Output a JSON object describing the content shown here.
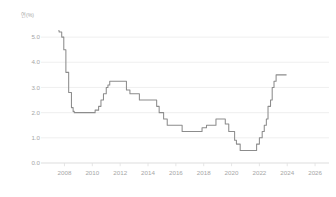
{
  "chart_data": {
    "type": "line",
    "title": "",
    "subtitle": "",
    "xlabel": "",
    "ylabel": "연(%)",
    "ylabel_text": "연(%)",
    "xlim": [
      2006.6,
      2027.0
    ],
    "ylim": [
      0.0,
      5.6
    ],
    "yticks": [
      0.0,
      1.0,
      2.0,
      3.0,
      4.0,
      5.0
    ],
    "ytick_labels": [
      "0.0",
      "1.0",
      "2.0",
      "3.0",
      "4.0",
      "5.0"
    ],
    "xticks": [
      2008,
      2010,
      2012,
      2014,
      2016,
      2018,
      2020,
      2022,
      2024,
      2026
    ],
    "xtick_labels": [
      "2008",
      "2010",
      "2012",
      "2014",
      "2016",
      "2018",
      "2020",
      "2022",
      "2024",
      "2026"
    ],
    "grid": true,
    "grid_axis": "y",
    "legend": false,
    "legend_position": "none",
    "line_color": "#8c8c8c",
    "grid_color": "#ececec",
    "axis_text_color": "#a6a6a6",
    "background_color": "#ffffff",
    "step_style": "post",
    "series": [
      {
        "name": "기준금리",
        "x": [
          2007.55,
          2007.62,
          2007.8,
          2007.95,
          2008.1,
          2008.3,
          2008.5,
          2008.62,
          2008.7,
          2008.78,
          2008.88,
          2009.0,
          2009.12,
          2009.4,
          2009.8,
          2010.2,
          2010.45,
          2010.62,
          2010.8,
          2011.0,
          2011.12,
          2011.25,
          2011.45,
          2011.62,
          2012.0,
          2012.45,
          2012.7,
          2013.0,
          2013.38,
          2013.8,
          2014.2,
          2014.62,
          2014.8,
          2015.12,
          2015.38,
          2015.62,
          2016.0,
          2016.45,
          2016.8,
          2017.3,
          2017.7,
          2017.88,
          2018.2,
          2018.6,
          2018.88,
          2019.2,
          2019.55,
          2019.8,
          2020.1,
          2020.22,
          2020.35,
          2020.62,
          2021.0,
          2021.4,
          2021.62,
          2021.8,
          2022.0,
          2022.2,
          2022.35,
          2022.5,
          2022.62,
          2022.8,
          2022.92,
          2023.05,
          2023.2,
          2023.95
        ],
        "values": [
          5.25,
          5.2,
          5.0,
          4.5,
          3.6,
          2.8,
          2.2,
          2.05,
          2.0,
          2.0,
          2.0,
          2.0,
          2.0,
          2.0,
          2.0,
          2.1,
          2.25,
          2.5,
          2.75,
          3.0,
          3.1,
          3.25,
          3.25,
          3.25,
          3.25,
          2.9,
          2.75,
          2.75,
          2.5,
          2.5,
          2.5,
          2.25,
          2.0,
          1.75,
          1.5,
          1.5,
          1.5,
          1.25,
          1.25,
          1.25,
          1.25,
          1.4,
          1.5,
          1.5,
          1.75,
          1.75,
          1.55,
          1.25,
          1.25,
          0.9,
          0.75,
          0.5,
          0.5,
          0.5,
          0.5,
          0.75,
          1.0,
          1.25,
          1.5,
          1.75,
          2.25,
          2.5,
          3.0,
          3.25,
          3.5,
          3.5
        ]
      }
    ]
  }
}
